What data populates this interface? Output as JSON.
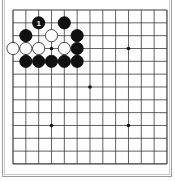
{
  "board": {
    "size": 13,
    "origin_x": 13,
    "origin_y": 10,
    "spacing": 12.83,
    "line_color": "#3a3a3a",
    "star_points": [
      [
        3,
        3
      ],
      [
        3,
        9
      ],
      [
        6,
        6
      ],
      [
        9,
        3
      ],
      [
        9,
        9
      ]
    ],
    "stones": [
      {
        "color": "black",
        "col": 2,
        "row": 1,
        "label": "1"
      },
      {
        "color": "black",
        "col": 4,
        "row": 1,
        "label": ""
      },
      {
        "color": "black",
        "col": 1,
        "row": 2,
        "label": ""
      },
      {
        "color": "white",
        "col": 3,
        "row": 2,
        "label": ""
      },
      {
        "color": "black",
        "col": 5,
        "row": 2,
        "label": ""
      },
      {
        "color": "white",
        "col": 0,
        "row": 3,
        "label": ""
      },
      {
        "color": "white",
        "col": 1,
        "row": 3,
        "label": ""
      },
      {
        "color": "white",
        "col": 2,
        "row": 3,
        "label": ""
      },
      {
        "color": "white",
        "col": 4,
        "row": 3,
        "label": ""
      },
      {
        "color": "black",
        "col": 5,
        "row": 3,
        "label": ""
      },
      {
        "color": "black",
        "col": 1,
        "row": 4,
        "label": ""
      },
      {
        "color": "black",
        "col": 2,
        "row": 4,
        "label": ""
      },
      {
        "color": "black",
        "col": 3,
        "row": 4,
        "label": ""
      },
      {
        "color": "black",
        "col": 4,
        "row": 4,
        "label": ""
      },
      {
        "color": "black",
        "col": 5,
        "row": 4,
        "label": ""
      }
    ]
  }
}
